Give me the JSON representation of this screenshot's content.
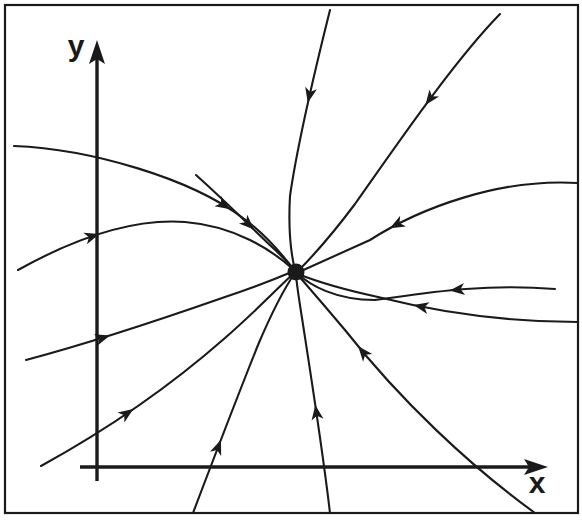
{
  "figure": {
    "width": 582,
    "height": 522,
    "background_color": "#ffffff",
    "stroke_color": "#1a1a1a",
    "frame": {
      "name": "figure-border",
      "left": 5,
      "top": 5,
      "right": 578,
      "bottom": 513,
      "stroke_width": 2.2
    }
  },
  "axes": {
    "origin": {
      "x": 97,
      "y": 467
    },
    "x_axis": {
      "label": "x",
      "label_x": 537,
      "label_y": 493,
      "start_x": 80,
      "end_x": 548,
      "y": 467,
      "stroke_width": 3.4,
      "arrow": "right"
    },
    "y_axis": {
      "label": "y",
      "label_x": 76,
      "label_y": 56,
      "x": 97,
      "start_y": 481,
      "end_y": 40,
      "stroke_width": 3.4,
      "arrow": "up"
    }
  },
  "chart_data": {
    "type": "line",
    "xlabel": "x",
    "ylabel": "y",
    "grid": false,
    "legend": false,
    "critical_point": {
      "name": "stable-node",
      "classification": "stable node (attractor)",
      "x": 296,
      "y": 272,
      "radius": 8.5
    },
    "flow_direction": "inward",
    "trajectory_count": 13,
    "arrowhead_count": 13,
    "trajectories": [
      {
        "id": "traj-1",
        "name": "upper-left-outer-inflow",
        "path": "M 14 146 C 90 149 190 178 243 218 C 265 234 285 258 294 270",
        "arrows": [
          {
            "t": 0.72,
            "direction": "toward-node"
          }
        ]
      },
      {
        "id": "traj-2",
        "name": "upper-left-arc-inflow",
        "path": "M 18 270 C 70 241 130 218 185 222 C 235 226 272 250 294 270",
        "arrows": [
          {
            "t": 0.3,
            "direction": "toward-node"
          }
        ]
      },
      {
        "id": "traj-3",
        "name": "mid-left-inflow",
        "path": "M 26 360 C 90 343 165 318 225 297 C 258 286 280 277 294 271",
        "arrows": [
          {
            "t": 0.31,
            "direction": "toward-node"
          }
        ]
      },
      {
        "id": "traj-4",
        "name": "lower-left-steep-inflow",
        "path": "M 41 466 C 110 428 175 382 225 338 C 258 309 282 284 294 273",
        "arrows": [
          {
            "t": 0.34,
            "direction": "toward-node"
          }
        ]
      },
      {
        "id": "traj-5",
        "name": "bottom-left-curving-inflow",
        "path": "M 193 513 C 215 455 238 395 258 345 C 275 305 288 283 295 273",
        "arrows": [
          {
            "t": 0.3,
            "direction": "toward-node"
          }
        ]
      },
      {
        "id": "traj-6",
        "name": "bottom-vertical-inflow",
        "path": "M 330 513 C 322 445 310 370 302 318 C 298 293 296 279 296 273",
        "arrows": [
          {
            "t": 0.45,
            "direction": "toward-node"
          }
        ]
      },
      {
        "id": "traj-7",
        "name": "lower-right-inner-inflow",
        "path": "M 535 513 C 470 466 400 400 345 330 C 318 298 303 281 297 274",
        "arrows": [
          {
            "t": 0.72,
            "direction": "toward-node"
          }
        ]
      },
      {
        "id": "traj-8",
        "name": "lower-right-shallow-inflow",
        "path": "M 578 322 C 500 322 430 310 378 297 C 332 287 308 278 298 274",
        "arrows": [
          {
            "t": 0.58,
            "direction": "toward-node"
          }
        ]
      },
      {
        "id": "traj-9",
        "name": "right-flat-inflow",
        "path": "M 555 289 C 480 283 420 294 375 300 C 335 300 310 285 298 274",
        "arrows": [
          {
            "t": 0.4,
            "direction": "toward-node"
          }
        ]
      },
      {
        "id": "traj-10",
        "name": "right-upper-outer-inflow",
        "path": "M 578 183 C 500 178 420 208 370 240 C 330 258 308 268 299 272",
        "arrows": [
          {
            "t": 0.66,
            "direction": "toward-node"
          }
        ]
      },
      {
        "id": "traj-11",
        "name": "upper-right-steep-inflow",
        "path": "M 500 14 C 455 60 400 140 355 204 C 325 244 305 264 298 271",
        "arrows": [
          {
            "t": 0.36,
            "direction": "toward-node"
          }
        ]
      },
      {
        "id": "traj-12",
        "name": "upper-center-inflow",
        "path": "M 330 10 C 315 70 298 140 290 196 C 288 232 292 258 295 270",
        "arrows": [
          {
            "t": 0.36,
            "direction": "toward-node"
          }
        ]
      },
      {
        "id": "traj-13",
        "name": "upper-left-inner-inflow",
        "path": "M 196 175 C 224 200 252 228 272 247 C 284 258 291 266 295 270",
        "arrows": [
          {
            "t": 0.58,
            "direction": "toward-node"
          }
        ]
      }
    ]
  }
}
